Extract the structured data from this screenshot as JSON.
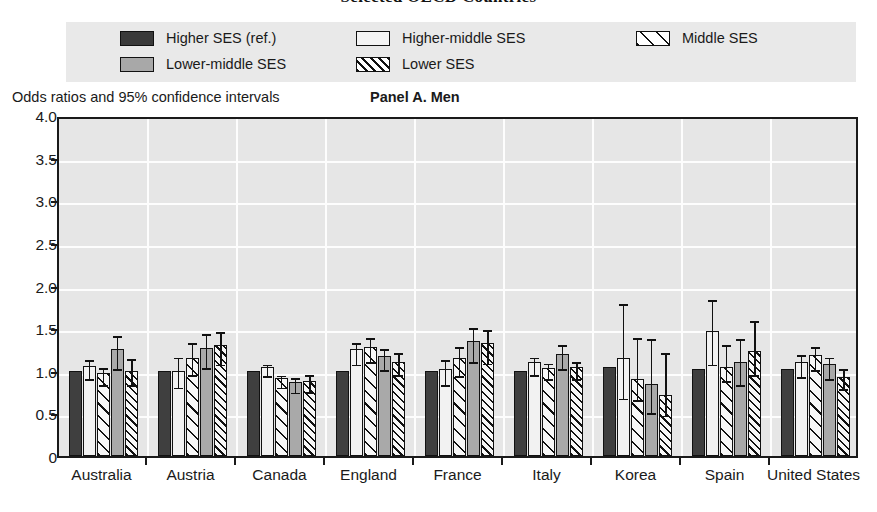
{
  "figure": {
    "title": "Selected OECD Countries",
    "axis_note": "Odds ratios and 95% confidence intervals",
    "panel_label": "Panel A. Men"
  },
  "legend": {
    "items": [
      {
        "label": "Higher SES (ref.)",
        "swatch": "solid-dark-swatch",
        "color": "#3a3a3a"
      },
      {
        "label": "Higher-middle SES",
        "swatch": "solid-white-swatch",
        "color": "#f4f4f4"
      },
      {
        "label": "Middle SES",
        "swatch": "diagonal-hatch-sparse-swatch",
        "color": "#ffffff"
      },
      {
        "label": "Lower-middle SES",
        "swatch": "solid-gray-swatch",
        "color": "#a8a8a8"
      },
      {
        "label": "Lower SES",
        "swatch": "diagonal-hatch-dense-swatch",
        "color": "#ffffff"
      }
    ]
  },
  "chart_data": {
    "type": "bar",
    "title": "Selected OECD Countries",
    "subtitle": "Panel A. Men",
    "xlabel": "",
    "ylabel": "Odds ratios and 95% confidence intervals",
    "ylim": [
      0,
      4.0
    ],
    "yticks": [
      "0",
      "0.5",
      "1.0",
      "1.5",
      "2.0",
      "2.5",
      "3.0",
      "3.5",
      "4.0"
    ],
    "ytick_values": [
      0,
      0.5,
      1.0,
      1.5,
      2.0,
      2.5,
      3.0,
      3.5,
      4.0
    ],
    "grid": true,
    "legend_position": "top",
    "error_bars": "95% confidence intervals",
    "categories": [
      "Australia",
      "Austria",
      "Canada",
      "England",
      "France",
      "Italy",
      "Korea",
      "Spain",
      "United States"
    ],
    "series": [
      {
        "name": "Higher SES (ref.)",
        "style": "solid-dark",
        "values": [
          1.0,
          1.0,
          1.0,
          1.0,
          1.0,
          1.0,
          1.05,
          1.02,
          1.02
        ],
        "ci_low": [
          null,
          null,
          null,
          null,
          null,
          null,
          null,
          null,
          null
        ],
        "ci_high": [
          null,
          null,
          null,
          null,
          null,
          null,
          null,
          null,
          null
        ]
      },
      {
        "name": "Higher-middle SES",
        "style": "solid-white",
        "values": [
          1.06,
          1.0,
          1.05,
          1.25,
          1.02,
          1.1,
          1.15,
          1.47,
          1.1
        ],
        "ci_low": [
          0.95,
          0.85,
          0.98,
          1.12,
          0.88,
          1.0,
          0.72,
          1.12,
          0.97
        ],
        "ci_high": [
          1.17,
          1.2,
          1.12,
          1.37,
          1.17,
          1.2,
          1.83,
          1.88,
          1.23
        ]
      },
      {
        "name": "Middle SES",
        "style": "hatch-sparse",
        "values": [
          0.97,
          1.15,
          0.92,
          1.28,
          1.15,
          1.03,
          0.9,
          1.05,
          1.18
        ],
        "ci_low": [
          0.88,
          1.0,
          0.85,
          1.15,
          0.98,
          0.95,
          0.7,
          0.93,
          1.05
        ],
        "ci_high": [
          1.08,
          1.37,
          0.99,
          1.43,
          1.32,
          1.13,
          1.43,
          1.35,
          1.32
        ]
      },
      {
        "name": "Lower-middle SES",
        "style": "solid-gray",
        "values": [
          1.25,
          1.27,
          0.87,
          1.17,
          1.35,
          1.2,
          0.85,
          1.1,
          1.08
        ],
        "ci_low": [
          1.07,
          1.08,
          0.79,
          1.05,
          1.15,
          1.07,
          0.55,
          0.88,
          0.95
        ],
        "ci_high": [
          1.45,
          1.48,
          0.96,
          1.3,
          1.55,
          1.35,
          1.42,
          1.42,
          1.2
        ]
      },
      {
        "name": "Lower SES",
        "style": "hatch-dense",
        "values": [
          1.0,
          1.3,
          0.88,
          1.1,
          1.32,
          1.04,
          0.72,
          1.23,
          0.93
        ],
        "ci_low": [
          0.88,
          1.12,
          0.8,
          1.0,
          1.13,
          0.95,
          0.52,
          1.0,
          0.83
        ],
        "ci_high": [
          1.18,
          1.5,
          1.0,
          1.25,
          1.52,
          1.15,
          1.25,
          1.63,
          1.07
        ]
      }
    ]
  }
}
